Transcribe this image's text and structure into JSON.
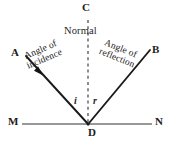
{
  "figure": {
    "background_color": "#ffffff",
    "width": 174,
    "height": 145
  },
  "labels": {
    "normal_point": "C",
    "normal_caption": "Normal",
    "incident_ray_end": "A",
    "reflected_ray_end": "B",
    "mirror_left_end": "M",
    "mirror_right_end": "N",
    "point_of_incidence": "D",
    "angle_incidence_symbol": "i",
    "angle_reflection_symbol": "r",
    "angle_incidence_line1": "Angle of",
    "angle_incidence_line2": "incidence",
    "angle_reflection_line1": "Angle of",
    "angle_reflection_line2": "reflection"
  },
  "colors": {
    "ray_stroke": "#1a1a1a",
    "mirror_stroke": "#767676",
    "normal_stroke": "#3a3a3a",
    "text": "#1f1f1f"
  },
  "geometry": {
    "vertex": {
      "x": 88,
      "y": 124
    },
    "incident_ray": {
      "x1": 26,
      "y1": 56,
      "x2": 88,
      "y2": 124
    },
    "reflected_ray": {
      "x1": 88,
      "y1": 124,
      "x2": 150,
      "y2": 50
    },
    "mirror_line": {
      "x1": 22,
      "y1": 124,
      "x2": 152,
      "y2": 124
    },
    "normal_line": {
      "x1": 88,
      "y1": 20,
      "x2": 88,
      "y2": 124
    },
    "normal_dash_pattern": "3,3",
    "arrow_marker": {
      "x": 40,
      "y": 72
    }
  }
}
